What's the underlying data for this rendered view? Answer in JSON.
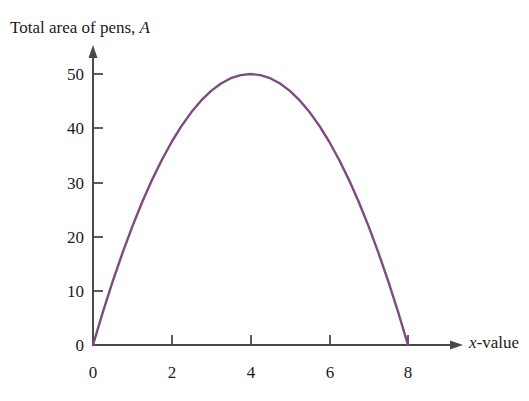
{
  "chart_data": {
    "type": "line",
    "title": "Total area of pens, A",
    "title_plain": "Total area of pens,",
    "title_italic_symbol": "A",
    "xlabel": "x-value",
    "xlabel_italic_symbol": "x",
    "xlabel_plain": "-value",
    "ylabel": "",
    "xlim": [
      0,
      8.6
    ],
    "ylim": [
      0,
      55
    ],
    "xticks": [
      0,
      2,
      4,
      6,
      8
    ],
    "xtick_labels": [
      "0",
      "2",
      "4",
      "6",
      "8"
    ],
    "yticks": [
      0,
      10,
      20,
      30,
      40,
      50
    ],
    "ytick_labels": [
      "0",
      "10",
      "20",
      "30",
      "40",
      "50"
    ],
    "grid": false,
    "legend": false,
    "legend_position": "none",
    "series": [
      {
        "name": "Total area of pens",
        "equation": "A = 12.5x(8 - x)",
        "color": "#7E4A80",
        "line_width": 2.4,
        "x": [
          0,
          0.25,
          0.5,
          0.75,
          1,
          1.25,
          1.5,
          1.75,
          2,
          2.25,
          2.5,
          2.75,
          3,
          3.25,
          3.5,
          3.75,
          4,
          4.25,
          4.5,
          4.75,
          5,
          5.25,
          5.5,
          5.75,
          6,
          6.25,
          6.5,
          6.75,
          7,
          7.25,
          7.5,
          7.75,
          8
        ],
        "values": [
          0,
          24.22,
          46.88,
          67.97,
          87.5,
          105.47,
          121.88,
          136.72,
          150,
          161.72,
          171.88,
          180.47,
          187.5,
          192.97,
          196.88,
          199.22,
          200,
          199.22,
          196.88,
          192.97,
          187.5,
          180.47,
          171.88,
          161.72,
          150,
          136.72,
          121.88,
          105.47,
          87.5,
          67.97,
          46.88,
          24.22,
          0
        ],
        "values_scaled": [
          0,
          6.05,
          11.72,
          16.99,
          21.88,
          26.37,
          30.47,
          34.18,
          37.5,
          40.43,
          42.97,
          45.12,
          46.88,
          48.24,
          49.22,
          49.8,
          50,
          49.8,
          49.22,
          48.24,
          46.88,
          45.12,
          42.97,
          40.43,
          37.5,
          34.18,
          30.47,
          26.37,
          21.88,
          16.99,
          11.72,
          6.05,
          0
        ],
        "roots": [
          0,
          8
        ],
        "vertex": {
          "x": 4,
          "y": 50
        }
      }
    ],
    "axis_color": "#4a4a4a",
    "background_color": "#ffffff",
    "arrows": {
      "x_axis": true,
      "y_axis": true
    }
  }
}
